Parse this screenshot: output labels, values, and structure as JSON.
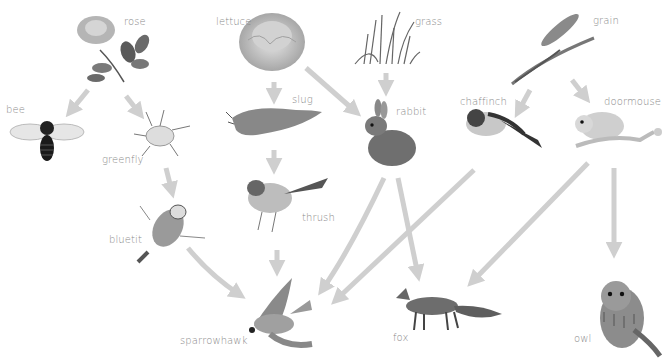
{
  "diagram": {
    "type": "food-web",
    "arrow_color": "#cfcfcf",
    "organisms": [
      {
        "id": "rose",
        "label": "rose",
        "x": 124,
        "y": 24
      },
      {
        "id": "lettuce",
        "label": "lettuce",
        "x": 244,
        "y": 24
      },
      {
        "id": "grass",
        "label": "grass",
        "x": 416,
        "y": 24
      },
      {
        "id": "grain",
        "label": "grain",
        "x": 594,
        "y": 22
      },
      {
        "id": "bee",
        "label": "bee",
        "x": 6,
        "y": 110
      },
      {
        "id": "greenfly",
        "label": "greenfly",
        "x": 103,
        "y": 160
      },
      {
        "id": "slug",
        "label": "slug",
        "x": 293,
        "y": 100
      },
      {
        "id": "rabbit",
        "label": "rabbit",
        "x": 396,
        "y": 112
      },
      {
        "id": "chaffinch",
        "label": "chaffinch",
        "x": 460,
        "y": 103
      },
      {
        "id": "doormouse",
        "label": "doormouse",
        "x": 604,
        "y": 102
      },
      {
        "id": "thrush",
        "label": "thrush",
        "x": 303,
        "y": 218
      },
      {
        "id": "bluetit",
        "label": "bluetit",
        "x": 109,
        "y": 240
      },
      {
        "id": "sparrowhawk",
        "label": "sparrowhawk",
        "x": 180,
        "y": 342
      },
      {
        "id": "fox",
        "label": "fox",
        "x": 392,
        "y": 338
      },
      {
        "id": "owl",
        "label": "owl",
        "x": 574,
        "y": 340
      }
    ],
    "links": [
      {
        "from": "rose",
        "to": "bee"
      },
      {
        "from": "rose",
        "to": "greenfly"
      },
      {
        "from": "greenfly",
        "to": "bluetit"
      },
      {
        "from": "bluetit",
        "to": "sparrowhawk"
      },
      {
        "from": "lettuce",
        "to": "slug"
      },
      {
        "from": "lettuce",
        "to": "rabbit"
      },
      {
        "from": "slug",
        "to": "thrush"
      },
      {
        "from": "thrush",
        "to": "sparrowhawk"
      },
      {
        "from": "grass",
        "to": "rabbit"
      },
      {
        "from": "rabbit",
        "to": "sparrowhawk"
      },
      {
        "from": "rabbit",
        "to": "fox"
      },
      {
        "from": "grain",
        "to": "chaffinch"
      },
      {
        "from": "grain",
        "to": "doormouse"
      },
      {
        "from": "chaffinch",
        "to": "sparrowhawk"
      },
      {
        "from": "doormouse",
        "to": "fox"
      },
      {
        "from": "doormouse",
        "to": "owl"
      }
    ]
  }
}
